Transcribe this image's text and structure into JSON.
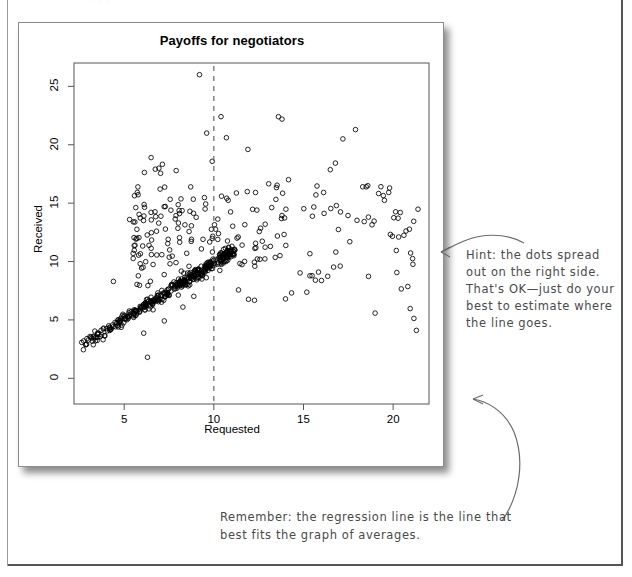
{
  "page": {
    "top_cropped_text": "·   ·      ·     ·        ·    ·       ·"
  },
  "figure": {
    "title": "Payoffs for negotiators"
  },
  "annotations": [
    {
      "name": "hint-note",
      "text": "Hint: the dots spread out on the right side. That's OK—just do your best to estimate where the line goes."
    },
    {
      "name": "remember-note",
      "text": "Remember: the regression line is the line that best fits the graph of averages."
    }
  ],
  "chart_data": {
    "type": "scatter",
    "title": "Payoffs for negotiators",
    "xlabel": "Requested",
    "ylabel": "Received",
    "xticks": [
      5,
      10,
      15,
      20
    ],
    "yticks": [
      0,
      5,
      10,
      15,
      20,
      25
    ],
    "xlim": [
      2.2,
      22.0
    ],
    "ylim": [
      -2.2,
      27.0
    ],
    "grid": false,
    "legend": null,
    "marker": "open-circle",
    "marker_color": "#000000",
    "marker_size": 3,
    "reference_lines": [
      {
        "name": "vertical-dashed-line",
        "orientation": "vertical",
        "x": 10,
        "style": "dashed",
        "color": "#555555"
      }
    ],
    "n_points": 620,
    "points_note": "Point coordinates are generated deterministically from the distribution parameters below to reproduce the printed cloud.",
    "distribution": {
      "tight_band": {
        "n": 380,
        "x_range": [
          2.6,
          11.2
        ],
        "y_equals_x_slope": 0.95,
        "y_intercept": 0.35,
        "y_noise_sd": 0.42
      },
      "spread_cloud": {
        "n": 240,
        "x_range": [
          5.5,
          21.8
        ],
        "y_range": [
          -1.6,
          26.2
        ],
        "y_center": 12.5,
        "y_sd": 5.2
      }
    }
  }
}
